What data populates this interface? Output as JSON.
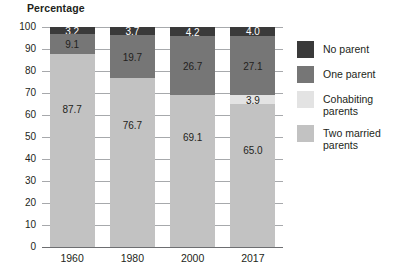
{
  "chart": {
    "title": "Percentage"
  },
  "chart_data": {
    "type": "bar",
    "subtype": "stacked-bar-100",
    "title": "Percentage",
    "subtitle": "",
    "xlabel": "",
    "ylabel": "Percentage",
    "ylim": [
      0,
      100
    ],
    "ytick_step": 10,
    "yticks": [
      "100",
      "90",
      "80",
      "70",
      "60",
      "50",
      "40",
      "30",
      "20",
      "10",
      "0"
    ],
    "grid": true,
    "grid_axis": "y",
    "legend_position": "right",
    "stack_order_bottom_to_top": [
      "Two married parents",
      "Cohabiting parents",
      "One parent",
      "No parent"
    ],
    "categories": [
      "1960",
      "1980",
      "2000",
      "2017"
    ],
    "series": [
      {
        "name": "Two married parents",
        "color": "#c2c2c2",
        "values": [
          87.7,
          76.7,
          69.1,
          65.0
        ],
        "labels": [
          "87.7",
          "76.7",
          "69.1",
          "65.0"
        ],
        "label_colors": [
          "#231f20",
          "#231f20",
          "#231f20",
          "#231f20"
        ]
      },
      {
        "name": "Cohabiting parents",
        "color": "#e3e3e3",
        "values": [
          0.0,
          0.0,
          0.0,
          3.9
        ],
        "labels": [
          "",
          "",
          "",
          "3.9"
        ],
        "label_colors": [
          "#231f20",
          "#231f20",
          "#231f20",
          "#231f20"
        ]
      },
      {
        "name": "One parent",
        "color": "#767676",
        "values": [
          9.1,
          19.7,
          26.7,
          27.1
        ],
        "labels": [
          "9.1",
          "19.7",
          "26.7",
          "27.1"
        ],
        "label_colors": [
          "#231f20",
          "#231f20",
          "#231f20",
          "#231f20"
        ]
      },
      {
        "name": "No parent",
        "color": "#3a3a3a",
        "values": [
          3.2,
          3.7,
          4.2,
          4.0
        ],
        "labels": [
          "3.2",
          "3.7",
          "4.2",
          "4.0"
        ],
        "label_colors": [
          "#ffffff",
          "#ffffff",
          "#ffffff",
          "#ffffff"
        ]
      }
    ],
    "legend": [
      {
        "label": "No parent",
        "color": "#3a3a3a"
      },
      {
        "label": "One parent",
        "color": "#767676"
      },
      {
        "label": "Cohabiting parents",
        "color": "#e3e3e3"
      },
      {
        "label": "Two married parents",
        "color": "#c2c2c2"
      }
    ],
    "colors": {
      "no_parent": "#3a3a3a",
      "one_parent": "#767676",
      "cohabiting_parents": "#e3e3e3",
      "two_married_parents": "#c2c2c2",
      "gridline": "#a7a9ac",
      "axis": "#6d6e71",
      "text": "#231f20",
      "background": "#ffffff"
    }
  }
}
